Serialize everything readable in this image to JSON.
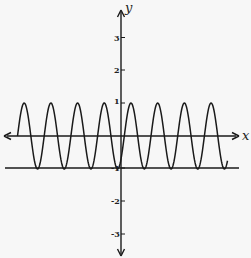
{
  "chart_data": {
    "type": "line",
    "title": "",
    "xlabel": "x",
    "ylabel": "y",
    "y_ticks": [
      3,
      2,
      1,
      -1,
      -2,
      -3
    ],
    "y_tick_labels": [
      "3",
      "2",
      "1",
      "-1",
      "-2",
      "-3"
    ],
    "x_ticks": [],
    "grid": false,
    "legend": null,
    "ylim": [
      -3.6,
      3.8
    ],
    "series": [
      {
        "name": "sinusoid",
        "function": "y = sin(k·x), amplitude 1, oscillating between 1 and -1",
        "amplitude": 1,
        "max": 1,
        "min": -1,
        "period_px": 26.7,
        "visible_cycles": 8,
        "color": "#1a1a1a"
      },
      {
        "name": "horizontal line y = -1",
        "function": "y = -1",
        "color": "#1a1a1a"
      }
    ]
  },
  "labels": {
    "x_axis": "x",
    "y_axis": "y",
    "ticks": {
      "t3": "3",
      "t2": "2",
      "t1": "1",
      "tm1": "-1",
      "tm2": "-2",
      "tm3": "-3"
    }
  },
  "colors": {
    "background": "#f7f7f7",
    "ink": "#1a1a1a"
  }
}
